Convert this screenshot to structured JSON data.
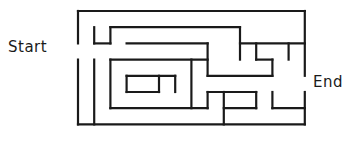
{
  "figure": {
    "type": "maze-puzzle",
    "canvas": {
      "width": 356,
      "height": 141
    },
    "background_color": "#ffffff",
    "wall_color": "#1a1a1a",
    "wall_thickness": 2.2
  },
  "labels": {
    "start": "Start",
    "end": "End"
  },
  "maze": {
    "origin_x": 78,
    "origin_y": 11,
    "cell": 16.2,
    "cols": 14,
    "rows": 7,
    "start_opening": {
      "side": "left",
      "row": 2
    },
    "end_opening": {
      "side": "right",
      "row": 4
    },
    "walls": [
      [
        0,
        0,
        14,
        0
      ],
      [
        0,
        7,
        14,
        7
      ],
      [
        0,
        0,
        0,
        2
      ],
      [
        0,
        3,
        0,
        7
      ],
      [
        14,
        0,
        14,
        4
      ],
      [
        14,
        5,
        14,
        7
      ],
      [
        1,
        1,
        1,
        2
      ],
      [
        1,
        2,
        2,
        2
      ],
      [
        2,
        1,
        10,
        1
      ],
      [
        2,
        1,
        2,
        2
      ],
      [
        10,
        1,
        10,
        3
      ],
      [
        10,
        2,
        14,
        2
      ],
      [
        3,
        2,
        8,
        2
      ],
      [
        8,
        2,
        8,
        4
      ],
      [
        1,
        3,
        1,
        7
      ],
      [
        2,
        3,
        8,
        3
      ],
      [
        2,
        3,
        2,
        6
      ],
      [
        2,
        6,
        8,
        6
      ],
      [
        8,
        3,
        8,
        3
      ],
      [
        3,
        4,
        6,
        4
      ],
      [
        3,
        4,
        3,
        5
      ],
      [
        3,
        5,
        5,
        5
      ],
      [
        6,
        4,
        6,
        5
      ],
      [
        7,
        3,
        7,
        6
      ],
      [
        8,
        4,
        12,
        4
      ],
      [
        12,
        3,
        12,
        4
      ],
      [
        11,
        2,
        11,
        3
      ],
      [
        11,
        3,
        12,
        3
      ],
      [
        8,
        5,
        11,
        5
      ],
      [
        9,
        5,
        9,
        7
      ],
      [
        8,
        5,
        8,
        6
      ],
      [
        9,
        6,
        11,
        6
      ],
      [
        11,
        5,
        11,
        6
      ],
      [
        12,
        5,
        12,
        6
      ],
      [
        12,
        6,
        14,
        6
      ],
      [
        5,
        4,
        5,
        5
      ],
      [
        13,
        2,
        13,
        3
      ]
    ]
  }
}
